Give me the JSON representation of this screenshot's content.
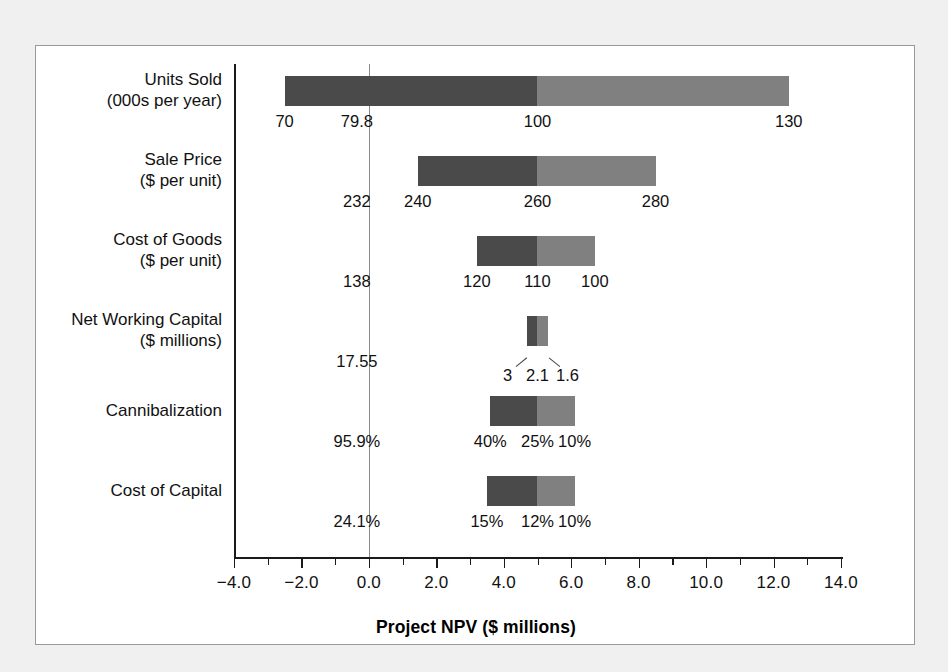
{
  "chart_data": {
    "type": "bar",
    "subtype": "tornado-sensitivity",
    "title": "",
    "xlabel": "Project NPV ($ millions)",
    "ylabel": "",
    "xlim": [
      -4.0,
      14.0
    ],
    "xticks": [
      "-4.0",
      "-2.0",
      "0.0",
      "2.0",
      "4.0",
      "6.0",
      "8.0",
      "10.0",
      "12.0",
      "14.0"
    ],
    "xtick_values": [
      -4,
      -2,
      0,
      2,
      4,
      6,
      8,
      10,
      12,
      14
    ],
    "minor_tick_step": 1.0,
    "grid": false,
    "legend": "none",
    "zero_line_at": 0.0,
    "colors": {
      "pessimistic_segment": "#4a4a4a",
      "optimistic_segment": "#808080",
      "axis": "#1a1a1a",
      "zero_line": "#8a8a8a",
      "panel_bg": "#ffffff",
      "page_bg": "#f0f0f0"
    },
    "categories": [
      {
        "label": "Units Sold\n(000s per year)",
        "breakeven": "79.8",
        "npv_low": -2.5,
        "npv_base": 5.0,
        "npv_high": 12.45,
        "low_label": "70",
        "base_label": "100",
        "high_label": "130",
        "label_style": "inline"
      },
      {
        "label": "Sale Price\n($ per unit)",
        "breakeven": "232",
        "npv_low": 1.45,
        "npv_base": 5.0,
        "npv_high": 8.5,
        "low_label": "240",
        "base_label": "260",
        "high_label": "280",
        "label_style": "inline"
      },
      {
        "label": "Cost of Goods\n($ per unit)",
        "breakeven": "138",
        "npv_low": 3.2,
        "npv_base": 5.0,
        "npv_high": 6.7,
        "low_label": "120",
        "base_label": "110",
        "high_label": "100",
        "label_style": "inline"
      },
      {
        "label": "Net Working Capital\n($ millions)",
        "breakeven": "17.55",
        "npv_low": 4.7,
        "npv_base": 5.0,
        "npv_high": 5.3,
        "low_label": "3",
        "base_label": "2.1",
        "high_label": "1.6",
        "label_style": "leader"
      },
      {
        "label": "Cannibalization",
        "breakeven": "95.9%",
        "npv_low": 3.6,
        "npv_base": 5.0,
        "npv_high": 6.1,
        "low_label": "40%",
        "base_label": "25%",
        "high_label": "10%",
        "label_style": "inline"
      },
      {
        "label": "Cost of Capital",
        "breakeven": "24.1%",
        "npv_low": 3.5,
        "npv_base": 5.0,
        "npv_high": 6.1,
        "low_label": "15%",
        "base_label": "12%",
        "high_label": "10%",
        "label_style": "inline"
      }
    ]
  }
}
